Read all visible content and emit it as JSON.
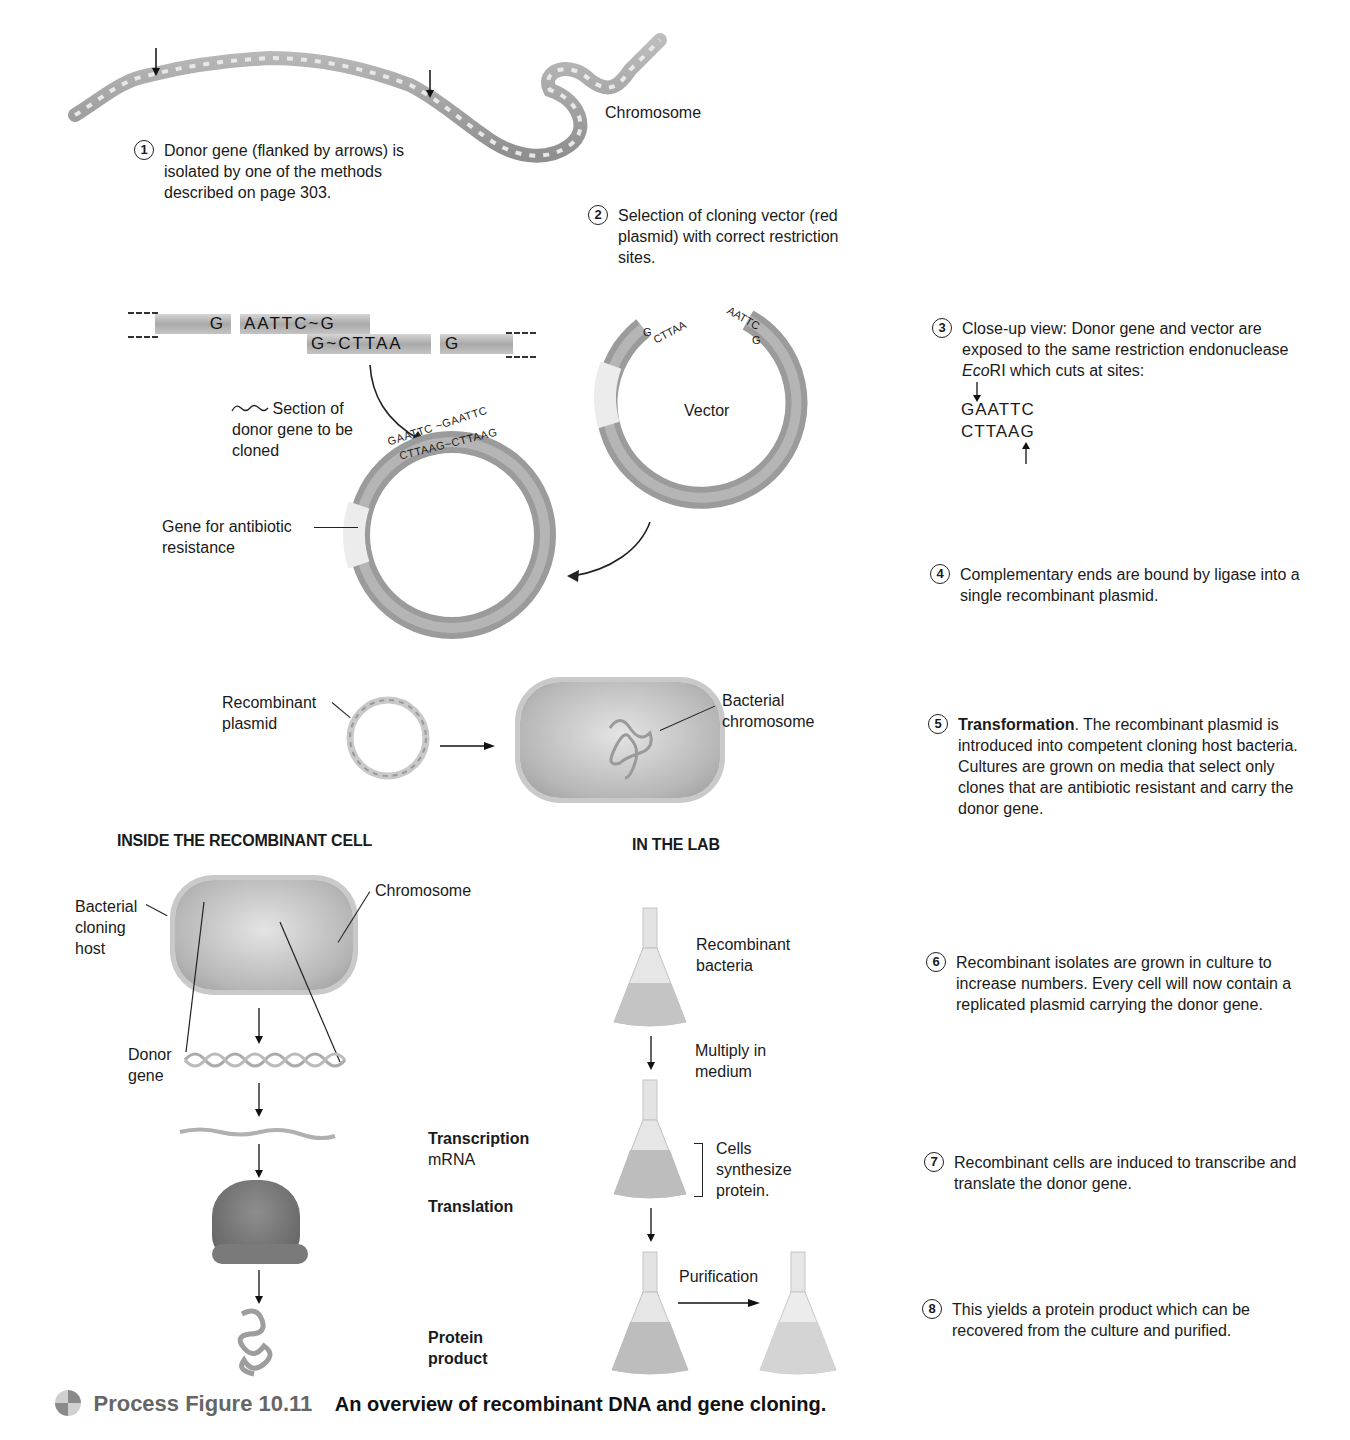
{
  "figure": {
    "label": "Process Figure 10.11",
    "caption": "An overview of recombinant DNA and gene cloning."
  },
  "top": {
    "chromosome_label": "Chromosome"
  },
  "steps": [
    {
      "num": "1",
      "text": "Donor gene (flanked by arrows) is isolated by one of the methods described on page 303."
    },
    {
      "num": "2",
      "text": "Selection of cloning vector (red plasmid) with correct restriction sites."
    },
    {
      "num": "3",
      "text_before": "Close-up view: Donor gene and vector are exposed to the same restriction endonuclease ",
      "text_italic": "Eco",
      "text_after": "RI which cuts at sites:",
      "site_top": "GAATTC",
      "site_bottom": "CTTAAG"
    },
    {
      "num": "4",
      "text": "Complementary ends are bound by ligase into a single recombinant plasmid."
    },
    {
      "num": "5",
      "bold": "Transformation",
      "text": ". The recombinant plasmid is introduced into competent cloning host bacteria. Cultures are grown on media that select only clones that are antibiotic resistant and carry the donor gene."
    },
    {
      "num": "6",
      "text": "Recombinant isolates are grown in culture to increase numbers. Every cell will now contain a replicated plasmid carrying the donor gene."
    },
    {
      "num": "7",
      "text": "Recombinant cells are induced to transcribe and translate the donor gene."
    },
    {
      "num": "8",
      "text": "This yields a protein product which can be recovered from the culture and purified."
    }
  ],
  "donor_fragment": {
    "left_top": "G",
    "mid_top": "AATTC~G",
    "mid_bottom": "G~CTTAA",
    "right_bottom": "G"
  },
  "labels": {
    "section_of_donor": "Section of donor gene to be cloned",
    "antibiotic_gene": "Gene for antibiotic resistance",
    "vector": "Vector",
    "recomb_seq_top": "GAATTC ~GAATTC",
    "recomb_seq_bottom": "CTTAAG~CTTAAG",
    "vector_end_left_top": "G",
    "vector_end_left_bottom": "CTTAA",
    "vector_end_right_top": "AATTC",
    "vector_end_right_bottom": "G",
    "recombinant_plasmid": "Recombinant plasmid",
    "bacterial_chromosome": "Bacterial chromosome"
  },
  "sections": {
    "inside": "INSIDE THE RECOMBINANT CELL",
    "lab": "IN THE LAB"
  },
  "inside_cell": {
    "host": "Bacterial cloning host",
    "chromosome": "Chromosome",
    "donor_gene": "Donor gene",
    "transcription": "Transcription",
    "mrna": "mRNA",
    "translation": "Translation",
    "protein_product": "Protein product"
  },
  "lab": {
    "recombinant_bacteria": "Recombinant bacteria",
    "multiply": "Multiply in medium",
    "cells_synthesize": "Cells synthesize protein.",
    "purification": "Purification"
  }
}
